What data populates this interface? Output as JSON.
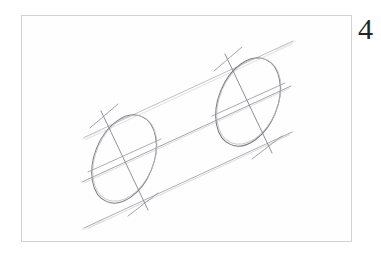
{
  "document": {
    "kind": "pencil-sketch-figure",
    "background_color": "#ffffff",
    "figure_number": "4"
  },
  "frame": {
    "border_color": "#d2d2d4",
    "fill_color": "#fefefe",
    "x": 21,
    "y": 15,
    "width": 331,
    "height": 227
  },
  "drawing": {
    "title": "Cylinder in perspective with construction lines",
    "medium": "graphite pencil",
    "stroke_colors": {
      "ellipse_strong": "#76767c",
      "ellipse_light": "#9b9ba1",
      "construction_line": "#a9a9af",
      "construction_line_faint": "#c3c3c8",
      "axis_line": "#8a8a90"
    },
    "near_ellipse": {
      "name": "near-end-ellipse",
      "center_x": 124,
      "center_y": 159,
      "radius_x": 29,
      "radius_y": 46,
      "rotation_deg": 22
    },
    "far_ellipse": {
      "name": "far-end-ellipse",
      "center_x": 248,
      "center_y": 102,
      "radius_x": 29,
      "radius_y": 46,
      "rotation_deg": 22
    },
    "axis": {
      "name": "cylinder-central-axis",
      "x1": 82,
      "y1": 182,
      "x2": 291,
      "y2": 86
    },
    "silhouette_top": {
      "name": "cylinder-top-contour",
      "x1": 84,
      "y1": 137,
      "x2": 293,
      "y2": 41
    },
    "silhouette_bottom": {
      "name": "cylinder-bottom-contour",
      "x1": 84,
      "y1": 228,
      "x2": 293,
      "y2": 132
    },
    "minor_axis_near": {
      "name": "near-ellipse-minor-axis",
      "x1": 88,
      "y1": 172,
      "x2": 160,
      "y2": 139
    },
    "minor_axis_far": {
      "name": "far-ellipse-minor-axis",
      "x1": 212,
      "y1": 116,
      "x2": 284,
      "y2": 83
    },
    "major_axis_near": {
      "name": "near-ellipse-major-axis",
      "x1": 101,
      "y1": 111,
      "x2": 148,
      "y2": 210
    },
    "major_axis_far": {
      "name": "far-ellipse-major-axis",
      "x1": 225,
      "y1": 54,
      "x2": 272,
      "y2": 153
    }
  }
}
